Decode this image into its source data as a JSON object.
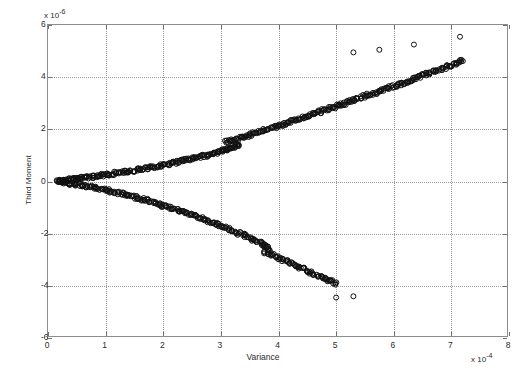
{
  "figure": {
    "background": "#ffffff",
    "plot_background": "#ffffff",
    "frame_color": "#8d8d8d",
    "grid_color": "#9a9a9a",
    "marker_color": "#101010"
  },
  "axis": {
    "x_name": "Variance",
    "y_name": "Third Moment",
    "x_exponent_prefix": "x 10",
    "x_exponent_value": "-4",
    "y_exponent_prefix": "x 10",
    "y_exponent_value": "-6",
    "x_ticklabels": [
      "0",
      "1",
      "2",
      "3",
      "4",
      "5",
      "6",
      "7",
      "8"
    ],
    "y_ticklabels": [
      "6",
      "4",
      "2",
      "0",
      "-2",
      "-4",
      "-6"
    ]
  },
  "chart_data": {
    "type": "scatter",
    "title": "",
    "xlabel": "Variance",
    "ylabel": "Third Moment",
    "xlim": [
      0,
      8
    ],
    "ylim": [
      -6,
      6
    ],
    "x_scale_factor": 0.0001,
    "y_scale_factor": 1e-06,
    "xticks": [
      0,
      1,
      2,
      3,
      4,
      5,
      6,
      7,
      8
    ],
    "yticks": [
      -6,
      -4,
      -2,
      0,
      2,
      4,
      6
    ],
    "grid": true,
    "legend": null,
    "marker": "open-circle",
    "marker_size": 5,
    "series": [
      {
        "name": "upper-branch",
        "comment": "positive third moment branch rising from origin",
        "points": [
          [
            0.18,
            0.02
          ],
          [
            0.22,
            0.03
          ],
          [
            0.26,
            0.04
          ],
          [
            0.3,
            0.05
          ],
          [
            0.34,
            0.06
          ],
          [
            0.38,
            0.07
          ],
          [
            0.42,
            0.08
          ],
          [
            0.46,
            0.09
          ],
          [
            0.5,
            0.1
          ],
          [
            0.55,
            0.12
          ],
          [
            0.6,
            0.13
          ],
          [
            0.65,
            0.15
          ],
          [
            0.7,
            0.16
          ],
          [
            0.75,
            0.18
          ],
          [
            0.8,
            0.19
          ],
          [
            0.85,
            0.21
          ],
          [
            0.9,
            0.23
          ],
          [
            0.95,
            0.24
          ],
          [
            1.0,
            0.26
          ],
          [
            1.06,
            0.28
          ],
          [
            1.12,
            0.3
          ],
          [
            1.18,
            0.32
          ],
          [
            1.24,
            0.34
          ],
          [
            1.3,
            0.36
          ],
          [
            1.36,
            0.38
          ],
          [
            1.42,
            0.4
          ],
          [
            1.48,
            0.42
          ],
          [
            1.54,
            0.45
          ],
          [
            1.6,
            0.47
          ],
          [
            1.66,
            0.49
          ],
          [
            1.72,
            0.52
          ],
          [
            1.78,
            0.54
          ],
          [
            1.84,
            0.57
          ],
          [
            1.9,
            0.59
          ],
          [
            1.96,
            0.62
          ],
          [
            2.02,
            0.65
          ],
          [
            2.08,
            0.68
          ],
          [
            2.14,
            0.7
          ],
          [
            2.2,
            0.73
          ],
          [
            2.26,
            0.76
          ],
          [
            2.32,
            0.79
          ],
          [
            2.38,
            0.82
          ],
          [
            2.44,
            0.85
          ],
          [
            2.5,
            0.88
          ],
          [
            2.56,
            0.91
          ],
          [
            2.62,
            0.94
          ],
          [
            2.68,
            0.97
          ],
          [
            2.74,
            1.0
          ],
          [
            2.8,
            1.04
          ],
          [
            2.86,
            1.07
          ],
          [
            2.92,
            1.1
          ],
          [
            2.98,
            1.14
          ],
          [
            3.02,
            1.17
          ],
          [
            3.06,
            1.2
          ],
          [
            3.1,
            1.23
          ],
          [
            3.14,
            1.26
          ],
          [
            3.18,
            1.29
          ],
          [
            3.22,
            1.33
          ],
          [
            3.26,
            1.36
          ],
          [
            3.3,
            1.4
          ],
          [
            3.1,
            1.52
          ],
          [
            3.16,
            1.56
          ],
          [
            3.22,
            1.6
          ],
          [
            3.28,
            1.64
          ],
          [
            3.34,
            1.68
          ],
          [
            3.4,
            1.72
          ],
          [
            3.46,
            1.76
          ],
          [
            3.52,
            1.8
          ],
          [
            3.58,
            1.84
          ],
          [
            3.64,
            1.88
          ],
          [
            3.7,
            1.93
          ],
          [
            3.76,
            1.97
          ],
          [
            3.82,
            2.01
          ],
          [
            3.88,
            2.05
          ],
          [
            3.94,
            2.09
          ],
          [
            4.0,
            2.14
          ],
          [
            4.06,
            2.18
          ],
          [
            4.12,
            2.22
          ],
          [
            4.18,
            2.27
          ],
          [
            4.24,
            2.31
          ],
          [
            4.3,
            2.36
          ],
          [
            4.36,
            2.4
          ],
          [
            4.42,
            2.45
          ],
          [
            4.48,
            2.49
          ],
          [
            4.54,
            2.54
          ],
          [
            4.6,
            2.58
          ],
          [
            4.66,
            2.63
          ],
          [
            4.72,
            2.67
          ],
          [
            4.78,
            2.72
          ],
          [
            4.84,
            2.76
          ],
          [
            4.9,
            2.81
          ],
          [
            4.96,
            2.85
          ],
          [
            5.02,
            2.9
          ],
          [
            5.08,
            2.95
          ],
          [
            5.14,
            2.99
          ],
          [
            5.2,
            3.04
          ],
          [
            5.26,
            3.08
          ],
          [
            5.32,
            3.13
          ],
          [
            5.38,
            3.18
          ],
          [
            5.44,
            3.22
          ],
          [
            5.5,
            3.27
          ],
          [
            5.56,
            3.32
          ],
          [
            5.62,
            3.36
          ],
          [
            5.68,
            3.41
          ],
          [
            5.74,
            3.46
          ],
          [
            5.8,
            3.5
          ],
          [
            5.86,
            3.55
          ],
          [
            5.92,
            3.6
          ],
          [
            5.98,
            3.64
          ],
          [
            6.04,
            3.69
          ],
          [
            6.1,
            3.74
          ],
          [
            6.16,
            3.78
          ],
          [
            6.22,
            3.83
          ],
          [
            6.28,
            3.88
          ],
          [
            6.34,
            3.93
          ],
          [
            6.4,
            3.97
          ],
          [
            6.46,
            4.02
          ],
          [
            6.52,
            4.07
          ],
          [
            6.58,
            4.12
          ],
          [
            6.64,
            4.16
          ],
          [
            6.7,
            4.21
          ],
          [
            6.76,
            4.26
          ],
          [
            6.82,
            4.31
          ],
          [
            6.88,
            4.36
          ],
          [
            6.94,
            4.41
          ],
          [
            7.0,
            4.46
          ],
          [
            7.06,
            4.51
          ],
          [
            7.12,
            4.56
          ],
          [
            7.18,
            4.61
          ]
        ]
      },
      {
        "name": "lower-branch-segment-1",
        "comment": "negative third moment branch descending from origin",
        "points": [
          [
            0.2,
            -0.02
          ],
          [
            0.25,
            -0.03
          ],
          [
            0.3,
            -0.05
          ],
          [
            0.35,
            -0.06
          ],
          [
            0.4,
            -0.08
          ],
          [
            0.45,
            -0.1
          ],
          [
            0.5,
            -0.12
          ],
          [
            0.56,
            -0.14
          ],
          [
            0.62,
            -0.16
          ],
          [
            0.68,
            -0.19
          ],
          [
            0.74,
            -0.21
          ],
          [
            0.8,
            -0.24
          ],
          [
            0.86,
            -0.26
          ],
          [
            0.92,
            -0.29
          ],
          [
            0.98,
            -0.32
          ],
          [
            1.04,
            -0.35
          ],
          [
            1.1,
            -0.38
          ],
          [
            1.16,
            -0.41
          ],
          [
            1.22,
            -0.44
          ],
          [
            1.28,
            -0.47
          ],
          [
            1.34,
            -0.5
          ],
          [
            1.4,
            -0.54
          ],
          [
            1.46,
            -0.57
          ],
          [
            1.52,
            -0.61
          ],
          [
            1.58,
            -0.64
          ],
          [
            1.64,
            -0.68
          ],
          [
            1.7,
            -0.72
          ],
          [
            1.76,
            -0.76
          ],
          [
            1.82,
            -0.8
          ],
          [
            1.88,
            -0.84
          ],
          [
            1.94,
            -0.88
          ],
          [
            2.0,
            -0.92
          ],
          [
            2.06,
            -0.96
          ],
          [
            2.12,
            -1.0
          ],
          [
            2.18,
            -1.05
          ],
          [
            2.24,
            -1.09
          ],
          [
            2.3,
            -1.14
          ],
          [
            2.36,
            -1.18
          ],
          [
            2.42,
            -1.23
          ],
          [
            2.48,
            -1.27
          ],
          [
            2.54,
            -1.32
          ],
          [
            2.6,
            -1.37
          ],
          [
            2.66,
            -1.42
          ],
          [
            2.72,
            -1.47
          ],
          [
            2.78,
            -1.52
          ],
          [
            2.84,
            -1.57
          ],
          [
            2.9,
            -1.62
          ],
          [
            2.96,
            -1.67
          ],
          [
            3.02,
            -1.72
          ],
          [
            3.08,
            -1.78
          ],
          [
            3.14,
            -1.83
          ],
          [
            3.2,
            -1.88
          ],
          [
            3.26,
            -1.94
          ],
          [
            3.32,
            -1.99
          ],
          [
            3.38,
            -2.05
          ],
          [
            3.44,
            -2.1
          ],
          [
            3.5,
            -2.16
          ],
          [
            3.56,
            -2.22
          ],
          [
            3.62,
            -2.28
          ],
          [
            3.68,
            -2.34
          ],
          [
            3.72,
            -2.4
          ],
          [
            3.76,
            -2.46
          ],
          [
            3.8,
            -2.52
          ],
          [
            3.84,
            -2.58
          ]
        ]
      },
      {
        "name": "lower-branch-segment-2",
        "comment": "second descending segment offset after a break near x=3.8",
        "points": [
          [
            3.78,
            -2.7
          ],
          [
            3.84,
            -2.76
          ],
          [
            3.9,
            -2.82
          ],
          [
            3.96,
            -2.88
          ],
          [
            4.02,
            -2.94
          ],
          [
            4.08,
            -3.0
          ],
          [
            4.14,
            -3.06
          ],
          [
            4.2,
            -3.12
          ],
          [
            4.26,
            -3.18
          ],
          [
            4.32,
            -3.24
          ],
          [
            4.38,
            -3.3
          ],
          [
            4.44,
            -3.36
          ],
          [
            4.5,
            -3.42
          ],
          [
            4.56,
            -3.48
          ],
          [
            4.62,
            -3.54
          ],
          [
            4.68,
            -3.6
          ],
          [
            4.74,
            -3.66
          ],
          [
            4.8,
            -3.72
          ],
          [
            4.86,
            -3.78
          ],
          [
            4.92,
            -3.84
          ],
          [
            4.98,
            -3.9
          ]
        ]
      },
      {
        "name": "upper-outliers",
        "comment": "isolated points above the main trend at high variance",
        "points": [
          [
            5.3,
            4.95
          ],
          [
            5.75,
            5.05
          ],
          [
            6.35,
            5.25
          ],
          [
            7.15,
            5.55
          ]
        ]
      },
      {
        "name": "lower-outliers",
        "comment": "isolated points below the lower branch",
        "points": [
          [
            5.0,
            -4.45
          ],
          [
            5.3,
            -4.4
          ]
        ]
      }
    ]
  }
}
